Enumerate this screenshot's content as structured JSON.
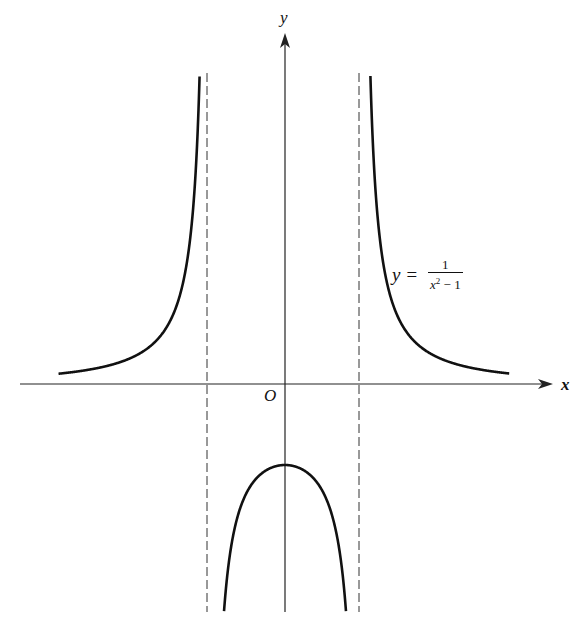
{
  "labels": {
    "y_axis": "y",
    "x_axis": "x",
    "origin": "O",
    "equation_lhs": "y =",
    "equation_numerator": "1",
    "equation_denominator_var": "x",
    "equation_denominator_exp": "2",
    "equation_denominator_rest": " − 1"
  },
  "chart_data": {
    "type": "line",
    "title": "",
    "function": "y = 1/(x^2 - 1)",
    "xlabel": "x",
    "ylabel": "y",
    "origin_label": "O",
    "annotation": "y = 1/(x² − 1)",
    "vertical_asymptotes": [
      -1,
      1
    ],
    "horizontal_asymptote": 0,
    "xlim": [
      -3.7,
      3.5
    ],
    "ylim": [
      -2.9,
      4.3
    ],
    "grid": false,
    "legend": null,
    "series": [
      {
        "name": "left branch",
        "domain": [
          -2.98,
          -1.11
        ],
        "points": [
          [
            -2.98,
            0.127
          ],
          [
            -2.5,
            0.19
          ],
          [
            -2.0,
            0.333
          ],
          [
            -1.5,
            0.8
          ],
          [
            -1.3,
            1.449
          ],
          [
            -1.2,
            2.273
          ],
          [
            -1.15,
            3.101
          ],
          [
            -1.12,
            3.937
          ]
        ]
      },
      {
        "name": "middle branch",
        "domain": [
          -0.84,
          0.84
        ],
        "points": [
          [
            -0.84,
            -3.4
          ],
          [
            -0.7,
            -1.961
          ],
          [
            -0.5,
            -1.333
          ],
          [
            0,
            -1.0
          ],
          [
            0.5,
            -1.333
          ],
          [
            0.7,
            -1.961
          ],
          [
            0.84,
            -3.4
          ]
        ]
      },
      {
        "name": "right branch",
        "domain": [
          1.11,
          2.95
        ],
        "points": [
          [
            1.12,
            3.937
          ],
          [
            1.15,
            3.101
          ],
          [
            1.2,
            2.273
          ],
          [
            1.3,
            1.449
          ],
          [
            1.5,
            0.8
          ],
          [
            2.0,
            0.333
          ],
          [
            2.5,
            0.19
          ],
          [
            2.95,
            0.13
          ]
        ]
      }
    ],
    "render": {
      "origin_px": [
        285,
        384
      ],
      "x_scale_px": 76,
      "y_scale_px": 81,
      "top_clip_px": 73,
      "bottom_clip_px": 612,
      "stroke": "#111111"
    }
  }
}
